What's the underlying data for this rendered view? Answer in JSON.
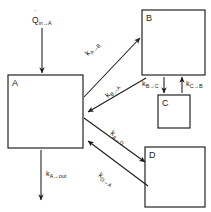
{
  "diagram": {
    "background_color": "#ffffff",
    "stroke_color": "#1a1a1a",
    "boxes": [
      {
        "id": "A",
        "label": "A",
        "x": 8,
        "y": 75,
        "width": 75,
        "height": 73
      },
      {
        "id": "B",
        "label": "B",
        "x": 142,
        "y": 10,
        "width": 63,
        "height": 65
      },
      {
        "id": "C",
        "label": "C",
        "x": 158,
        "y": 95,
        "width": 32,
        "height": 33
      },
      {
        "id": "D",
        "label": "D",
        "x": 145,
        "y": 147,
        "width": 60,
        "height": 60
      }
    ],
    "heat_input": {
      "symbol": "Q",
      "dot": "˙",
      "subscript": "in→A",
      "full_label": "Q̇ in→A",
      "arrow_from": [
        42,
        28
      ],
      "arrow_to": [
        42,
        73
      ]
    },
    "rates": [
      {
        "id": "k_A_to_B",
        "base": "k",
        "subscript": "A→B",
        "full_label": "k A→B",
        "from_box": "A",
        "to_box": "B",
        "arrow_from": [
          84,
          97
        ],
        "arrow_to": [
          140,
          38
        ],
        "label_x": 88,
        "label_y": 56,
        "label_rotation": -46
      },
      {
        "id": "k_B_to_A",
        "base": "k",
        "subscript": "B→A",
        "full_label": "k B→A",
        "from_box": "B",
        "to_box": "A",
        "arrow_from": [
          146,
          78
        ],
        "arrow_to": [
          88,
          112
        ],
        "label_x": 108,
        "label_y": 98,
        "label_rotation": -46
      },
      {
        "id": "k_B_to_C",
        "base": "k",
        "subscript": "B→C",
        "full_label": "k B→C",
        "from_box": "B",
        "to_box": "C",
        "arrow_from": [
          164,
          77
        ],
        "arrow_to": [
          164,
          93
        ],
        "label_x": 142,
        "label_y": 86,
        "label_rotation": 0
      },
      {
        "id": "k_C_to_B",
        "base": "k",
        "subscript": "C→B",
        "full_label": "k C→B",
        "from_box": "C",
        "to_box": "B",
        "arrow_from": [
          182,
          93
        ],
        "arrow_to": [
          182,
          77
        ],
        "label_x": 186,
        "label_y": 86,
        "label_rotation": 0
      },
      {
        "id": "k_A_to_D",
        "base": "k",
        "subscript": "A→D",
        "full_label": "k A→D",
        "from_box": "A",
        "to_box": "D",
        "arrow_from": [
          84,
          118
        ],
        "arrow_to": [
          145,
          162
        ],
        "label_x": 110,
        "label_y": 134,
        "label_rotation": 36
      },
      {
        "id": "k_D_to_A",
        "base": "k",
        "subscript": "D→A",
        "full_label": "k D→A",
        "from_box": "D",
        "to_box": "A",
        "arrow_from": [
          148,
          186
        ],
        "arrow_to": [
          88,
          141
        ],
        "label_x": 98,
        "label_y": 176,
        "label_rotation": 36
      },
      {
        "id": "k_A_to_out",
        "base": "k",
        "subscript": "A→out",
        "full_label": "k A→out",
        "from_box": "A",
        "to_box": "out",
        "arrow_from": [
          41,
          150
        ],
        "arrow_to": [
          41,
          200
        ],
        "label_x": 46,
        "label_y": 176,
        "label_rotation": 0
      }
    ]
  }
}
